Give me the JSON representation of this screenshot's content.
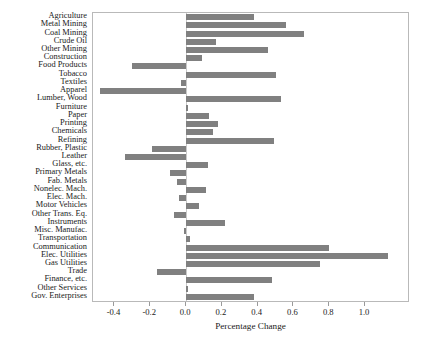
{
  "chart_data": {
    "type": "bar",
    "orientation": "horizontal",
    "title": "",
    "xlabel": "Percentage Change",
    "ylabel": "",
    "xlim": [
      -0.52,
      1.24
    ],
    "xticks": [
      -0.4,
      -0.2,
      0.0,
      0.2,
      0.4,
      0.6,
      0.8,
      1.0
    ],
    "xticklabels": [
      "-0.4",
      "-0.2",
      "0.0",
      "0.2",
      "0.4",
      "0.6",
      "0.8",
      "1.0"
    ],
    "grid": false,
    "legend": null,
    "bar_color": "#808080",
    "frame_color": "#b9b9b9",
    "categories": [
      "Agriculture",
      "Metal Mining",
      "Coal Mining",
      "Crude Oil",
      "Other Mining",
      "Construction",
      "Food Products",
      "Tobacco",
      "Textiles",
      "Apparel",
      "Lumber, Wood",
      "Furniture",
      "Paper",
      "Printing",
      "Chemicals",
      "Refining",
      "Rubber, Plastic",
      "Leather",
      "Glass, etc.",
      "Primary Metals",
      "Fab. Metals",
      "Nonelec. Mach.",
      "Elec. Mach.",
      "Motor Vehicles",
      "Other Trans. Eq.",
      "Instruments",
      "Misc. Manufac.",
      "Transportation",
      "Communication",
      "Elec. Utilities",
      "Gas Utilities",
      "Trade",
      "Finance, etc.",
      "Other Services",
      "Gov. Enterprises"
    ],
    "values": [
      0.38,
      0.56,
      0.66,
      0.17,
      0.46,
      0.09,
      -0.3,
      0.5,
      -0.03,
      -0.48,
      0.53,
      0.01,
      0.13,
      0.18,
      0.15,
      0.49,
      -0.19,
      -0.34,
      0.12,
      -0.09,
      -0.05,
      0.11,
      -0.04,
      0.07,
      -0.07,
      0.22,
      -0.01,
      0.02,
      0.8,
      1.13,
      0.75,
      -0.16,
      0.48,
      0.01,
      0.38
    ]
  }
}
